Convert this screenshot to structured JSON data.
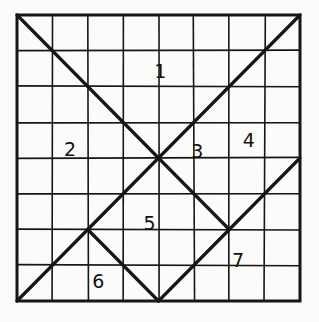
{
  "figure": {
    "kind": "line-drawing",
    "style": "hand-drawn ink on paper",
    "background_color": "#fbfbf9",
    "ink_color": "#161616",
    "grid": {
      "columns": 8,
      "rows": 8,
      "x_min_px": 17,
      "y_min_px": 15,
      "x_max_px": 300,
      "y_max_px": 301,
      "cell_width_px": 35.375,
      "cell_height_px": 35.75,
      "border_stroke_px": 3,
      "gridline_stroke_px": 1.6,
      "diagonal_stroke_px": 3.2
    },
    "labels": [
      {
        "id": "label-1",
        "text": "1",
        "grid_x": 4.05,
        "grid_y": 1.75
      },
      {
        "id": "label-2",
        "text": "2",
        "grid_x": 1.5,
        "grid_y": 3.95
      },
      {
        "id": "label-3",
        "text": "3",
        "grid_x": 5.1,
        "grid_y": 4.0
      },
      {
        "id": "label-4",
        "text": "4",
        "grid_x": 6.55,
        "grid_y": 3.7
      },
      {
        "id": "label-5",
        "text": "5",
        "grid_x": 3.75,
        "grid_y": 6.0
      },
      {
        "id": "label-6",
        "text": "6",
        "grid_x": 2.3,
        "grid_y": 7.65
      },
      {
        "id": "label-7",
        "text": "7",
        "grid_x": 6.25,
        "grid_y": 7.05
      }
    ],
    "diagonals": [
      {
        "id": "diag-main-ne",
        "from": [
          0,
          8
        ],
        "to": [
          8,
          0
        ],
        "note": "bottom-left to top-right full diagonal"
      },
      {
        "id": "diag-main-se",
        "from": [
          0,
          0
        ],
        "to": [
          6,
          6
        ],
        "note": "top-left through center to right junction"
      },
      {
        "id": "diag-v-left",
        "from": [
          2,
          6
        ],
        "to": [
          4,
          8
        ],
        "note": "left arm of bottom V"
      },
      {
        "id": "diag-v-right",
        "from": [
          4,
          8
        ],
        "to": [
          6,
          6
        ],
        "note": "right arm of bottom V"
      },
      {
        "id": "diag-lower-right",
        "from": [
          6,
          6
        ],
        "to": [
          8,
          4
        ],
        "note": "upper-right arm from junction"
      }
    ]
  }
}
